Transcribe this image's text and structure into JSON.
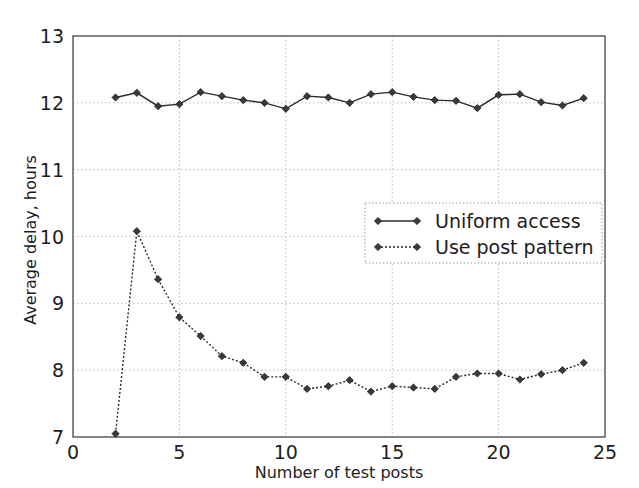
{
  "chart_data": {
    "type": "line",
    "title": "",
    "xlabel": "Number of test posts",
    "ylabel": "Average delay, hours",
    "xlim": [
      0,
      25
    ],
    "ylim": [
      7,
      13
    ],
    "xticks": [
      "0",
      "5",
      "10",
      "15",
      "20",
      "25"
    ],
    "xtick_values": [
      0,
      5,
      10,
      15,
      20,
      25
    ],
    "yticks": [
      "7",
      "8",
      "9",
      "10",
      "11",
      "12",
      "13"
    ],
    "ytick_values": [
      7,
      8,
      9,
      10,
      11,
      12,
      13
    ],
    "grid": true,
    "legend_position": "center-right",
    "x": [
      2,
      3,
      4,
      5,
      6,
      7,
      8,
      9,
      10,
      11,
      12,
      13,
      14,
      15,
      16,
      17,
      18,
      19,
      20,
      21,
      22,
      23,
      24
    ],
    "series": [
      {
        "name": "Uniform access",
        "linestyle": "solid",
        "marker": "diamond",
        "color": "#2b2b2b",
        "values": [
          12.08,
          12.15,
          11.95,
          11.98,
          12.16,
          12.1,
          12.04,
          12.0,
          11.91,
          12.1,
          12.08,
          12.0,
          12.13,
          12.16,
          12.09,
          12.04,
          12.03,
          11.92,
          12.12,
          12.13,
          12.01,
          11.96,
          12.07
        ]
      },
      {
        "name": "Use post pattern",
        "linestyle": "dotted",
        "marker": "diamond",
        "color": "#2b2b2b",
        "values": [
          7.05,
          10.08,
          9.36,
          8.79,
          8.51,
          8.21,
          8.11,
          7.9,
          7.9,
          7.72,
          7.76,
          7.85,
          7.68,
          7.76,
          7.74,
          7.72,
          7.9,
          7.95,
          7.95,
          7.86,
          7.94,
          8.0,
          8.11
        ]
      }
    ],
    "legend_entries": [
      "Uniform access",
      "Use post pattern"
    ]
  },
  "axes": {
    "x_axis_label": "Number of test posts",
    "y_axis_label": "Average delay, hours"
  },
  "legend": {
    "items": [
      {
        "label": "Uniform access"
      },
      {
        "label": "Use post pattern"
      }
    ]
  }
}
